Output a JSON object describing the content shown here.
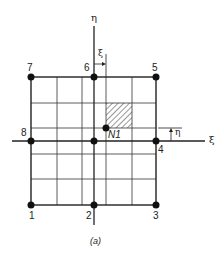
{
  "figure": {
    "caption": "(a)",
    "axes": {
      "horizontal_label": "ξ",
      "vertical_label": "η"
    },
    "dimensions": {
      "xi_label": "ξ",
      "eta_label": "η"
    },
    "point": {
      "label": "N1"
    },
    "nodes": [
      {
        "id": "1",
        "label": "1"
      },
      {
        "id": "2",
        "label": "2"
      },
      {
        "id": "3",
        "label": "3"
      },
      {
        "id": "4",
        "label": "4"
      },
      {
        "id": "5",
        "label": "5"
      },
      {
        "id": "6",
        "label": "6"
      },
      {
        "id": "7",
        "label": "7"
      },
      {
        "id": "8",
        "label": "8"
      }
    ],
    "colors": {
      "line": "#222222",
      "background": "#ffffff"
    }
  }
}
